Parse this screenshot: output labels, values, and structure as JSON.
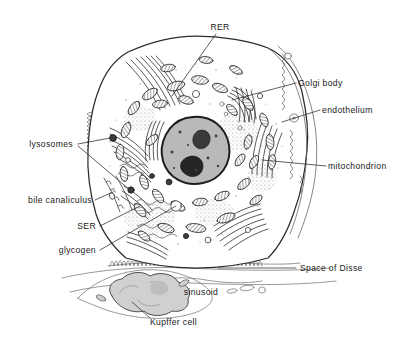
{
  "figure": {
    "background_color": "#ffffff",
    "ink_color": "#2b2b2b",
    "nucleus_fill": "#b9b9b9",
    "nucleolus_fill": "#2e2e2e",
    "kupffer_fill": "#cdcdcd",
    "width": 408,
    "height": 340
  },
  "labels": {
    "rer": "RER",
    "golgi_body": "Golgi body",
    "endothelium": "endothelium",
    "mitochondrion": "mitochondrion",
    "lysosomes": "lysosomes",
    "bile_canaliculus": "bile canaliculus",
    "ser": "SER",
    "glycogen": "glycogen",
    "space_of_disse": "Space of Disse",
    "sinusoid": "sinusoid",
    "kupffer_cell": "Kupffer cell"
  },
  "label_positions": {
    "rer": {
      "x": 220,
      "y": 27,
      "align": "c"
    },
    "golgi_body": {
      "x": 298,
      "y": 83,
      "align": "l"
    },
    "endothelium": {
      "x": 322,
      "y": 110,
      "align": "l"
    },
    "mitochondrion": {
      "x": 328,
      "y": 166,
      "align": "l"
    },
    "lysosomes": {
      "x": 73,
      "y": 144,
      "align": "r"
    },
    "bile_canaliculus": {
      "x": 92,
      "y": 200,
      "align": "r"
    },
    "ser": {
      "x": 96,
      "y": 226,
      "align": "r"
    },
    "glycogen": {
      "x": 96,
      "y": 250,
      "align": "r"
    },
    "space_of_disse": {
      "x": 300,
      "y": 268,
      "align": "l"
    },
    "sinusoid": {
      "x": 201,
      "y": 292,
      "align": "c"
    },
    "kupffer_cell": {
      "x": 150,
      "y": 322,
      "align": "l"
    }
  }
}
